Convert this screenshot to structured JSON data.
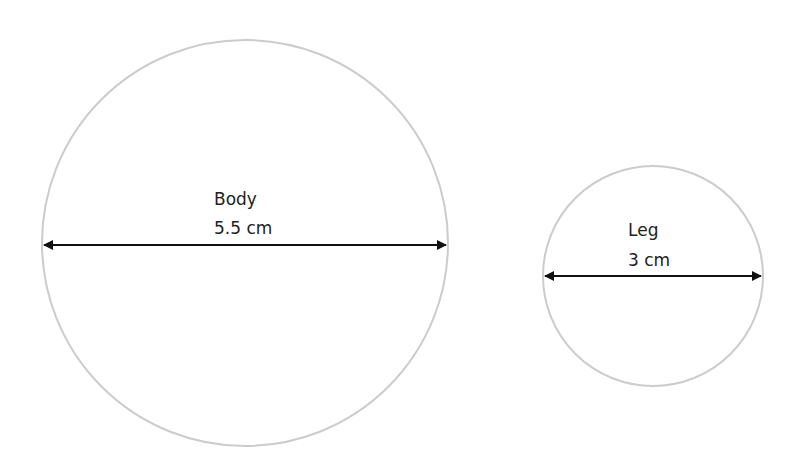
{
  "diagram": {
    "circles": [
      {
        "id": "body",
        "name": "Body",
        "measurement": "5.5 cm",
        "cx": 245,
        "cy": 243,
        "r": 203,
        "arrow_y": 245
      },
      {
        "id": "leg",
        "name": "Leg",
        "measurement": "3 cm",
        "cx": 653,
        "cy": 276,
        "r": 110,
        "arrow_y": 276
      }
    ],
    "colors": {
      "circle_stroke": "#cccccc",
      "arrow": "#111111",
      "text": "#222222"
    }
  }
}
